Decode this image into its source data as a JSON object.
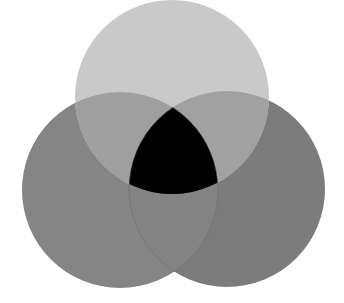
{
  "diagram": {
    "type": "venn",
    "sets": 3,
    "background": "#ffffff",
    "circles": [
      {
        "id": "top",
        "cx": 172,
        "cy": 97,
        "r": 97,
        "color": "#c9c9c9"
      },
      {
        "id": "left",
        "cx": 120,
        "cy": 190,
        "r": 98,
        "color": "#858585"
      },
      {
        "id": "right",
        "cx": 227,
        "cy": 189,
        "r": 98,
        "color": "#7c7c7c"
      }
    ],
    "regions": {
      "top_only": "#c9c9c9",
      "left_only": "#858585",
      "right_only": "#7c7c7c",
      "top_left": "#9f9f9f",
      "top_right": "#a1a1a1",
      "left_right": "#838383",
      "all_three": "#000000"
    },
    "labels": []
  }
}
